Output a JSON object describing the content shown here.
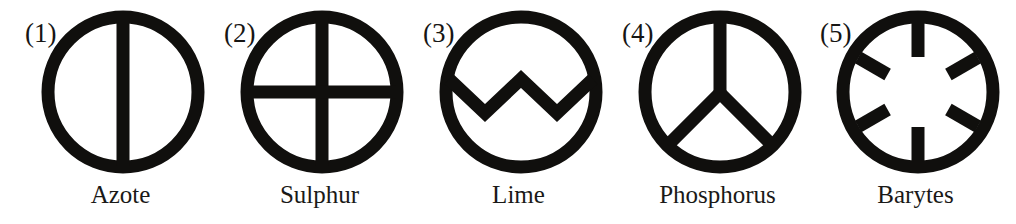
{
  "plate": {
    "background_color": "#ffffff",
    "ink_color": "#100f0d",
    "symbol_count": 5
  },
  "symbols": [
    {
      "index_label": "(1)",
      "name": "Azote",
      "icon_name": "circle-vertical-bar-icon",
      "mark": "vertical line through circle"
    },
    {
      "index_label": "(2)",
      "name": "Sulphur",
      "icon_name": "circle-cross-icon",
      "mark": "vertical and horizontal cross through circle"
    },
    {
      "index_label": "(3)",
      "name": "Lime",
      "icon_name": "circle-zigzag-icon",
      "mark": "zigzag band across circle"
    },
    {
      "index_label": "(4)",
      "name": "Phosphorus",
      "icon_name": "circle-tri-radiant-icon",
      "mark": "vertical stem with two lower diagonals"
    },
    {
      "index_label": "(5)",
      "name": "Barytes",
      "icon_name": "circle-six-spokes-icon",
      "mark": "six inward radial spokes"
    }
  ]
}
